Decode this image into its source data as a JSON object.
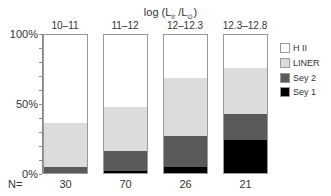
{
  "chart_data": {
    "type": "bar",
    "stacked": true,
    "title_parts": {
      "prefix": "log (L",
      "sub1": "ir",
      "mid": " /L",
      "sub2": "⊙",
      "suffix": ")"
    },
    "categories": [
      "10–11",
      "11–12",
      "12–12.3",
      "12.3–12.8"
    ],
    "n_label": "N=",
    "n_values": [
      30,
      70,
      26,
      21
    ],
    "ylabel": "",
    "xlabel": "",
    "ylim": [
      0,
      100
    ],
    "yticks": [
      "100%",
      "50%",
      "0%"
    ],
    "legend_position": "right",
    "series": [
      {
        "name": "Sey 1",
        "color": "#000000",
        "values": [
          0,
          1.5,
          4,
          24
        ]
      },
      {
        "name": "Sey 2",
        "color": "#5a5a5a",
        "values": [
          4,
          14.5,
          23,
          19
        ]
      },
      {
        "name": "LINER",
        "color": "#dcdcdc",
        "values": [
          32,
          32,
          42,
          33
        ]
      },
      {
        "name": "H II",
        "color": "#ffffff",
        "values": [
          64,
          52,
          31,
          24
        ]
      }
    ]
  },
  "legend": [
    {
      "label": "H II",
      "color": "#ffffff"
    },
    {
      "label": "LINER",
      "color": "#dcdcdc"
    },
    {
      "label": "Sey 2",
      "color": "#5a5a5a"
    },
    {
      "label": "Sey 1",
      "color": "#000000"
    }
  ]
}
